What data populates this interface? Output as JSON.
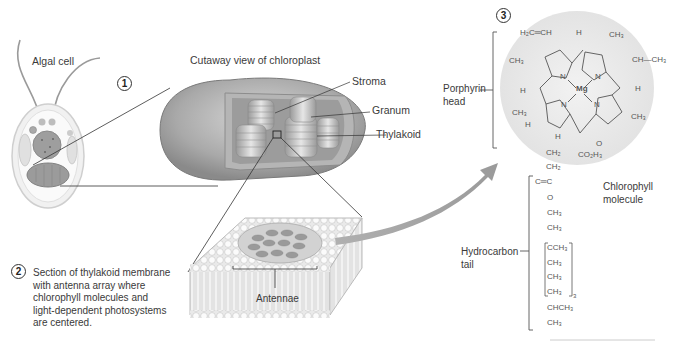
{
  "figure": {
    "panels": [
      {
        "number": "1",
        "label": "Algal cell"
      },
      {
        "title": "Cutaway view of chloroplast",
        "labels": [
          "Stroma",
          "Granum",
          "Thylakoid"
        ]
      },
      {
        "number": "2",
        "caption": [
          "Section of thylakoid membrane",
          "with antenna array where",
          "chlorophyll molecules and",
          "light-dependent photosystems",
          "are centered."
        ],
        "label": "Antennae"
      },
      {
        "number": "3",
        "labels": {
          "head": [
            "Porphyrin",
            "head"
          ],
          "tail": [
            "Hydrocarbon",
            "tail"
          ],
          "molecule": [
            "Chlorophyll",
            "molecule"
          ]
        }
      }
    ],
    "chemistry": {
      "center": "Mg",
      "nitrogen": "N",
      "groups": {
        "vinyl": "H₂C═CH",
        "h_top": "H",
        "ch3_top": "CH₃",
        "ethyl": "CH—CH₃",
        "ch3_left": "CH₃",
        "h_left": "H",
        "h_right": "H",
        "ch3_left2": "CH₃",
        "h_left2": "H",
        "ch3_right": "CH₃",
        "h_bottom": "H",
        "carbonyl_o": "O",
        "ester": "CO₂H₃",
        "ch2_1": "CH₂",
        "ch2_2": "CH₂"
      },
      "tail": [
        "C═C",
        "O",
        "CH₃",
        "CH₃",
        "CCH₃",
        "CH₃",
        "CH₃",
        "CH₃",
        "CHCH₃",
        "CH₃"
      ],
      "repeat_subscript": "3"
    }
  }
}
